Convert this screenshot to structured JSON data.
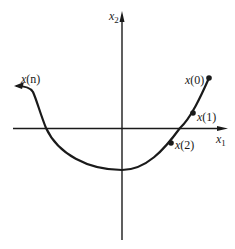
{
  "diagram": {
    "type": "phase-plane trajectory",
    "axes": {
      "horizontal": {
        "label": "x",
        "subscript": "1"
      },
      "vertical": {
        "label": "x",
        "subscript": "2"
      }
    },
    "points": [
      {
        "id": "x0",
        "label_base": "x",
        "label_arg": "(0)"
      },
      {
        "id": "x1",
        "label_base": "x",
        "label_arg": "(1)"
      },
      {
        "id": "x2",
        "label_base": "x",
        "label_arg": "(2)"
      },
      {
        "id": "xn",
        "label_base": "x",
        "label_arg": "(n)"
      }
    ],
    "colors": {
      "ink": "#1a1a1a",
      "background": "#ffffff"
    }
  }
}
